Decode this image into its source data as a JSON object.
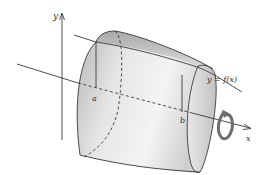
{
  "figure": {
    "labels": {
      "y_axis": "y",
      "x_axis": "x",
      "curve": "y = f(x)",
      "a": "a",
      "b": "b"
    },
    "icons": [
      "rotation-arrow-icon"
    ],
    "colors": {
      "line": "#3a3a3a",
      "surface_light": "#f2f2f2",
      "surface_dark": "#b8b8b8",
      "rotation_arrow": "#6e6e6e",
      "background": "#ffffff"
    }
  }
}
